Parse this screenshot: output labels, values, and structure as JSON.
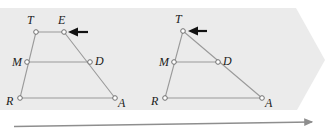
{
  "figure": {
    "background_shape": {
      "name": "banner-chevron",
      "fill": "#ebebeb",
      "points": "0,8 296,8 325,60 297,110 0,110"
    },
    "stroke_color": "#9a9a9a",
    "vertex_fill": "#ffffff",
    "arrow_color": "#111111",
    "panels": [
      {
        "id": "before",
        "name": "trapezoid-panel",
        "vertices": [
          {
            "label": "T",
            "x": 36,
            "y": 32,
            "label_x": 27,
            "label_y": 24
          },
          {
            "label": "E",
            "x": 64,
            "y": 32,
            "label_x": 58,
            "label_y": 24
          },
          {
            "label": "M",
            "x": 27,
            "y": 62,
            "label_x": 12,
            "label_y": 64
          },
          {
            "label": "D",
            "x": 90,
            "y": 62,
            "label_x": 95,
            "label_y": 63
          },
          {
            "label": "R",
            "x": 20,
            "y": 98,
            "label_x": 6,
            "label_y": 104
          },
          {
            "label": "A",
            "x": 115,
            "y": 98,
            "label_x": 118,
            "label_y": 106
          }
        ],
        "segments": [
          {
            "name": "segment-TE",
            "from": "T",
            "to": "E"
          },
          {
            "name": "segment-TR",
            "from": "T",
            "to": "R"
          },
          {
            "name": "segment-EA",
            "from": "E",
            "to": "A"
          },
          {
            "name": "segment-RA",
            "from": "R",
            "to": "A"
          },
          {
            "name": "segment-MD",
            "from": "M",
            "to": "D"
          }
        ],
        "drag_arrow": {
          "name": "drag-arrow-left",
          "tail_x": 88,
          "tip_x": 68,
          "y": 32
        }
      },
      {
        "id": "after",
        "name": "triangle-panel",
        "vertices": [
          {
            "label": "T",
            "x": 183,
            "y": 31,
            "label_x": 175,
            "label_y": 23
          },
          {
            "label": "M",
            "x": 174,
            "y": 62,
            "label_x": 159,
            "label_y": 64
          },
          {
            "label": "D",
            "x": 218,
            "y": 62,
            "label_x": 223,
            "label_y": 63
          },
          {
            "label": "R",
            "x": 165,
            "y": 98,
            "label_x": 151,
            "label_y": 104
          },
          {
            "label": "A",
            "x": 262,
            "y": 98,
            "label_x": 265,
            "label_y": 106
          }
        ],
        "segments": [
          {
            "name": "segment-TR",
            "from": "T",
            "to": "R"
          },
          {
            "name": "segment-TA",
            "from": "T",
            "to": "A"
          },
          {
            "name": "segment-RA",
            "from": "R",
            "to": "A"
          },
          {
            "name": "segment-MD",
            "from": "M",
            "to": "D"
          }
        ],
        "drag_arrow": {
          "name": "drag-arrow-right",
          "tail_x": 207,
          "tip_x": 188,
          "y": 31
        }
      }
    ],
    "timeline_arrow": {
      "name": "timeline-arrow",
      "x1": 14,
      "y1": 126,
      "x2": 316,
      "y2": 122,
      "color": "#8e8e8e"
    }
  }
}
